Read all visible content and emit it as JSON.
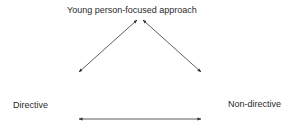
{
  "diagram": {
    "nodes": {
      "top": "Young person-focused approach",
      "left": "Directive",
      "right": "Non-directive"
    },
    "edges": [
      {
        "from": "top",
        "to": "left",
        "type": "bidirectional-arrow"
      },
      {
        "from": "top",
        "to": "right",
        "type": "bidirectional-arrow"
      },
      {
        "from": "left",
        "to": "right",
        "type": "bidirectional-arrow"
      }
    ],
    "colors": {
      "line": "#333333",
      "text": "#2a2a2a",
      "background": "#ffffff"
    }
  }
}
